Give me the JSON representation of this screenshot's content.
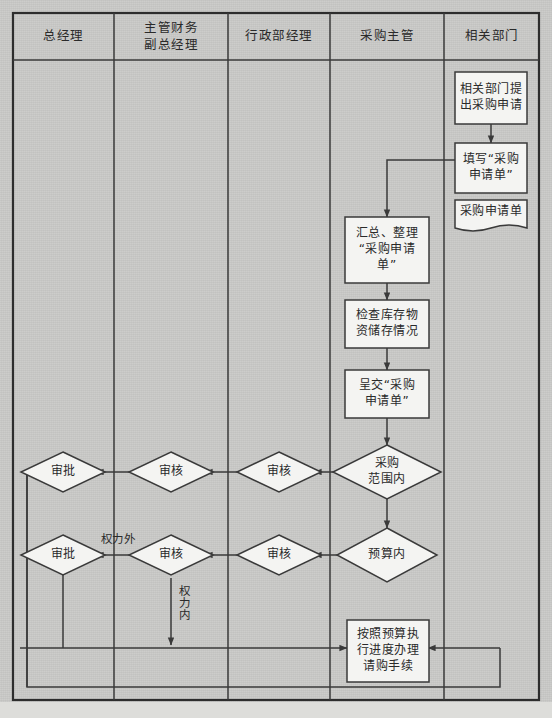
{
  "diagram": {
    "type": "cross-functional-flowchart",
    "colors": {
      "page_background": "#c9c9c7",
      "node_fill": "#f4f4f2",
      "line": "#3a3a3a",
      "text": "#2a2a2a"
    },
    "lanes": [
      {
        "id": "lane-general-manager",
        "label": "总经理",
        "x": 13,
        "width": 101
      },
      {
        "id": "lane-finance-vp",
        "label": "主管财务\n副总经理",
        "label_line1": "主管财务",
        "label_line2": "副总经理",
        "x": 114,
        "width": 114
      },
      {
        "id": "lane-admin-manager",
        "label": "行政部经理",
        "x": 228,
        "width": 102
      },
      {
        "id": "lane-purchasing-head",
        "label": "采购主管",
        "x": 330,
        "width": 114
      },
      {
        "id": "lane-related-dept",
        "label": "相关部门",
        "x": 444,
        "width": 95
      }
    ],
    "nodes": [
      {
        "id": "n-request",
        "lane": "lane-related-dept",
        "shape": "rect",
        "text": "相关部门提出采购申请",
        "line1": "相关部门提",
        "line2": "出采购申请"
      },
      {
        "id": "n-fill-form",
        "lane": "lane-related-dept",
        "shape": "rect",
        "text": "填写“采购申请单”",
        "line1": "填写“采购",
        "line2": "申请单”"
      },
      {
        "id": "n-form-doc",
        "lane": "lane-related-dept",
        "shape": "document",
        "text": "采购申请单",
        "line1": "采购申请单"
      },
      {
        "id": "n-collect",
        "lane": "lane-purchasing-head",
        "shape": "rect",
        "text": "汇总、整理“采购申请单”",
        "line1": "汇总、整理",
        "line2": "“采购申请",
        "line3": "单”"
      },
      {
        "id": "n-check-stock",
        "lane": "lane-purchasing-head",
        "shape": "rect",
        "text": "检查库存物资储存情况",
        "line1": "检查库存物",
        "line2": "资储存情况"
      },
      {
        "id": "n-submit",
        "lane": "lane-purchasing-head",
        "shape": "rect",
        "text": "呈交“采购申请单”",
        "line1": "呈交“采购",
        "line2": "申请单”"
      },
      {
        "id": "n-in-scope",
        "lane": "lane-purchasing-head",
        "shape": "diamond",
        "text": "采购范围内",
        "line1": "采购",
        "line2": "范围内"
      },
      {
        "id": "n-review-admin-1",
        "lane": "lane-admin-manager",
        "shape": "diamond",
        "text": "审核"
      },
      {
        "id": "n-review-fin-1",
        "lane": "lane-finance-vp",
        "shape": "diamond",
        "text": "审核"
      },
      {
        "id": "n-approve-gm-1",
        "lane": "lane-general-manager",
        "shape": "diamond",
        "text": "审批"
      },
      {
        "id": "n-in-budget",
        "lane": "lane-purchasing-head",
        "shape": "diamond",
        "text": "预算内"
      },
      {
        "id": "n-review-admin-2",
        "lane": "lane-admin-manager",
        "shape": "diamond",
        "text": "审核"
      },
      {
        "id": "n-review-fin-2",
        "lane": "lane-finance-vp",
        "shape": "diamond",
        "text": "审核"
      },
      {
        "id": "n-approve-gm-2",
        "lane": "lane-general-manager",
        "shape": "diamond",
        "text": "审批"
      },
      {
        "id": "n-process",
        "lane": "lane-purchasing-head",
        "shape": "rect",
        "text": "按照预算执行进度办理请购手续",
        "line1": "按照预算执",
        "line2": "行进度办理",
        "line3": "请购手续"
      }
    ],
    "edge_labels": [
      {
        "id": "lbl-out-of-authority",
        "text": "权力外",
        "orientation": "horizontal",
        "between": "n-review-fin-2 → n-approve-gm-2"
      },
      {
        "id": "lbl-in-authority",
        "text": "权力内",
        "orientation": "vertical",
        "between": "n-review-fin-2 → n-process"
      }
    ],
    "edges": [
      {
        "from": "n-request",
        "to": "n-fill-form",
        "kind": "arrow-down"
      },
      {
        "from": "n-fill-form",
        "to": "n-collect",
        "kind": "elbow-left-down"
      },
      {
        "from": "n-collect",
        "to": "n-check-stock",
        "kind": "arrow-down"
      },
      {
        "from": "n-check-stock",
        "to": "n-submit",
        "kind": "arrow-down"
      },
      {
        "from": "n-submit",
        "to": "n-in-scope",
        "kind": "arrow-down"
      },
      {
        "from": "n-in-scope",
        "to": "n-review-admin-1",
        "kind": "arrow-left"
      },
      {
        "from": "n-review-admin-1",
        "to": "n-review-fin-1",
        "kind": "arrow-left"
      },
      {
        "from": "n-review-fin-1",
        "to": "n-approve-gm-1",
        "kind": "arrow-left"
      },
      {
        "from": "n-in-scope",
        "to": "n-in-budget",
        "kind": "arrow-down"
      },
      {
        "from": "n-in-budget",
        "to": "n-review-admin-2",
        "kind": "arrow-left"
      },
      {
        "from": "n-review-admin-2",
        "to": "n-review-fin-2",
        "kind": "arrow-left"
      },
      {
        "from": "n-review-fin-2",
        "to": "n-approve-gm-2",
        "kind": "arrow-left",
        "label": "权力外"
      },
      {
        "from": "n-review-fin-2",
        "to": "n-process",
        "kind": "elbow-down-right",
        "label": "权力内"
      },
      {
        "from": "n-approve-gm-1",
        "to": "n-process",
        "kind": "return-left-outer"
      },
      {
        "from": "n-approve-gm-2",
        "to": "n-process",
        "kind": "return-left-inner"
      },
      {
        "from": "n-process",
        "to": "n-process",
        "kind": "return-right-loop"
      }
    ]
  }
}
